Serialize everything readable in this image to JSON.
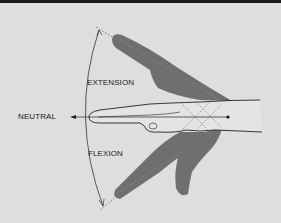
{
  "figure": {
    "type": "anatomical-diagram",
    "labels": {
      "extension": "EXTENSION",
      "neutral": "NEUTRAL",
      "flexion": "FLEXION"
    },
    "colors": {
      "background": "#dedede",
      "hand_fill": "#6f6f6f",
      "outline": "#2a2a2a",
      "top_border": "#1a1a1a"
    }
  }
}
